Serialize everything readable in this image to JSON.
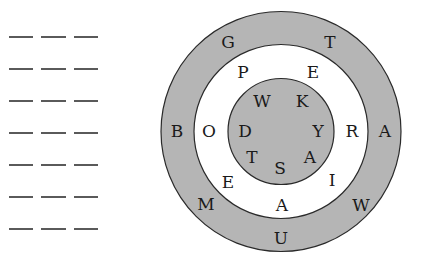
{
  "answer_blanks": {
    "rows": 7,
    "blanks_per_row": 3,
    "row_y": [
      37,
      69,
      101,
      133,
      165,
      197,
      229
    ],
    "blank_x": [
      [
        9,
        33
      ],
      [
        41,
        66
      ],
      [
        74,
        98
      ]
    ]
  },
  "wheel": {
    "center": [
      281,
      131.5
    ],
    "colors": {
      "shaded": "#b5b5b5",
      "white": "#ffffff",
      "stroke": "#2a2a2a"
    },
    "rings": {
      "outer": {
        "radius": 120,
        "fill": "shaded",
        "letters": [
          {
            "char": "G",
            "x": 228,
            "y": 42
          },
          {
            "char": "T",
            "x": 330,
            "y": 42
          },
          {
            "char": "B",
            "x": 177,
            "y": 131
          },
          {
            "char": "A",
            "x": 385,
            "y": 131
          },
          {
            "char": "M",
            "x": 206,
            "y": 204
          },
          {
            "char": "W",
            "x": 361,
            "y": 205
          },
          {
            "char": "U",
            "x": 281,
            "y": 238
          }
        ]
      },
      "middle": {
        "radius": 87,
        "fill": "white",
        "letters": [
          {
            "char": "P",
            "x": 243,
            "y": 72
          },
          {
            "char": "E",
            "x": 313,
            "y": 72
          },
          {
            "char": "O",
            "x": 209,
            "y": 131
          },
          {
            "char": "R",
            "x": 352,
            "y": 131
          },
          {
            "char": "E",
            "x": 228,
            "y": 182
          },
          {
            "char": "I",
            "x": 332,
            "y": 180
          },
          {
            "char": "A",
            "x": 282,
            "y": 205
          }
        ]
      },
      "inner": {
        "radius": 53,
        "fill": "shaded",
        "letters": [
          {
            "char": "W",
            "x": 262,
            "y": 101
          },
          {
            "char": "K",
            "x": 302,
            "y": 101
          },
          {
            "char": "D",
            "x": 245,
            "y": 131
          },
          {
            "char": "Y",
            "x": 318,
            "y": 131
          },
          {
            "char": "T",
            "x": 252,
            "y": 157
          },
          {
            "char": "A",
            "x": 310,
            "y": 157
          },
          {
            "char": "S",
            "x": 280,
            "y": 168
          }
        ]
      }
    }
  }
}
